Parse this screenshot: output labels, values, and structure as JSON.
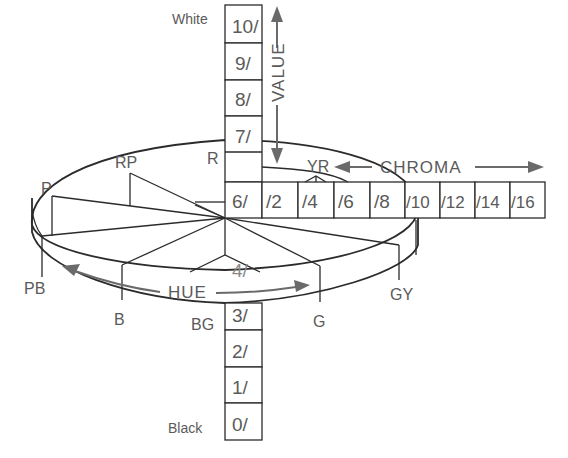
{
  "diagram": {
    "value_axis": {
      "label": "VALUE",
      "top_label": "White",
      "bottom_label": "Black",
      "upper_cells": [
        "10/",
        "9/",
        "8/",
        "7/",
        "6/"
      ],
      "lower_cells": [
        "4/",
        "3/",
        "2/",
        "1/",
        "0/"
      ]
    },
    "chroma_axis": {
      "label": "CHROMA",
      "cells": [
        "/2",
        "/4",
        "/6",
        "/8",
        "/10",
        "/12",
        "/14",
        "/16"
      ]
    },
    "hue_axis": {
      "label": "HUE",
      "hues": [
        "R",
        "YR",
        "GY",
        "G",
        "BG",
        "B",
        "PB",
        "P",
        "RP"
      ]
    }
  }
}
